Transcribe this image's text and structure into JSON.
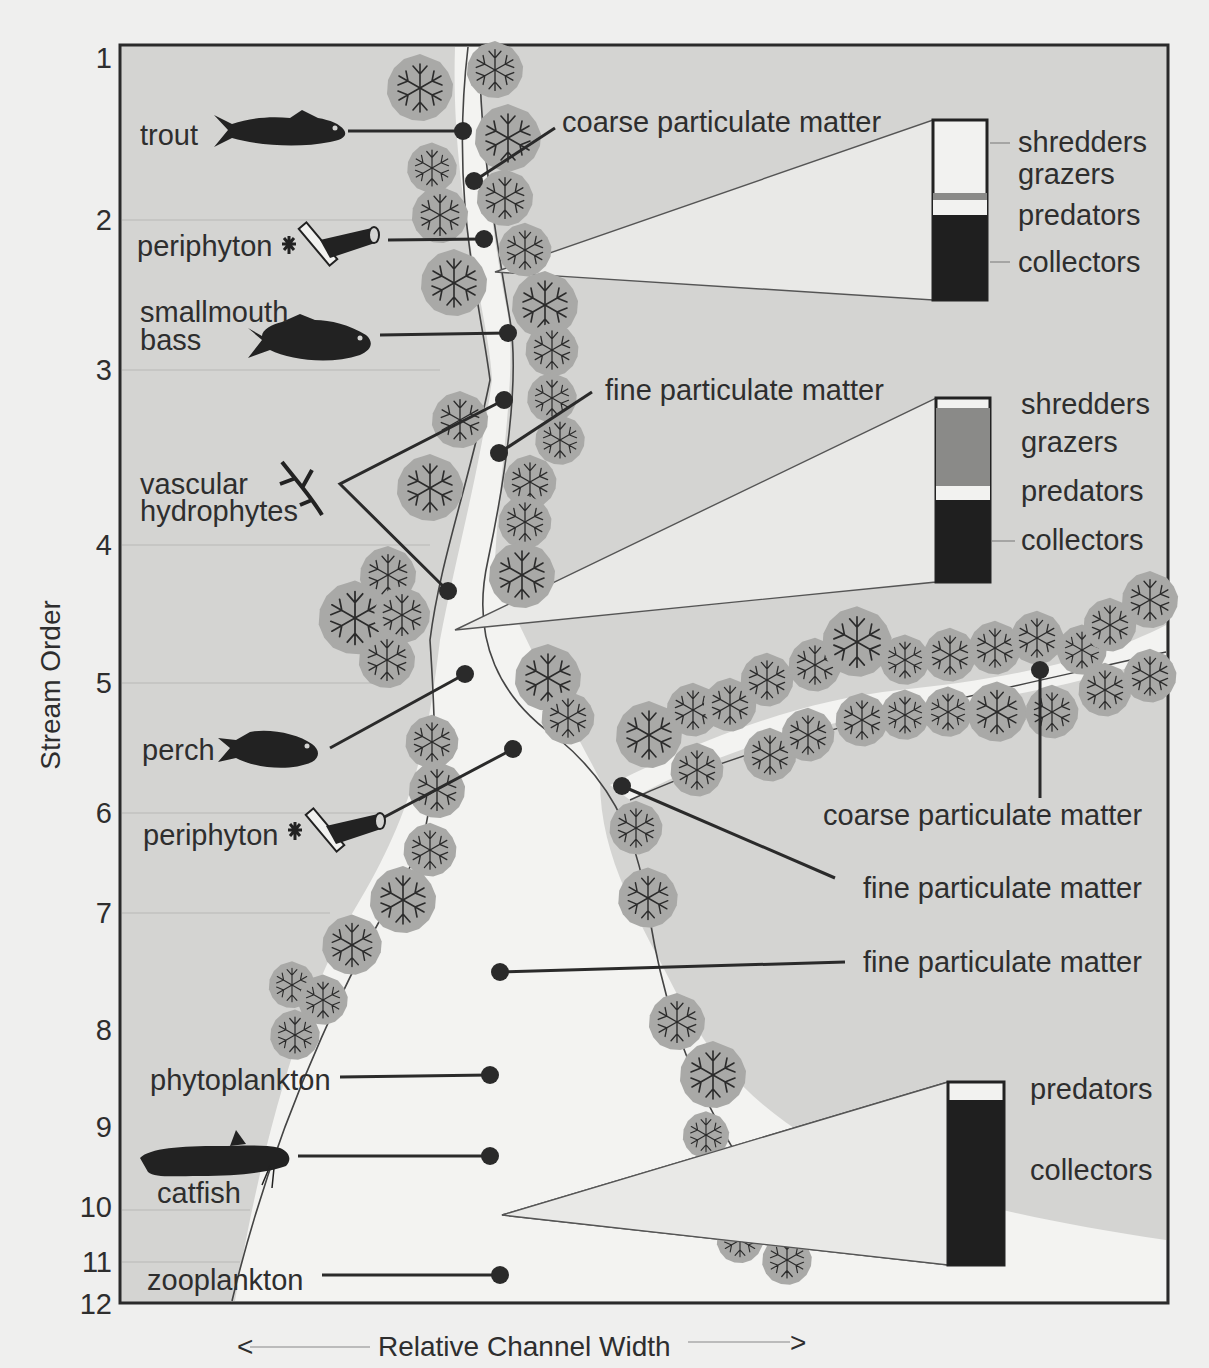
{
  "figure": {
    "y_axis_label": "Stream Order",
    "x_axis_label": "Relative Channel Width",
    "x_axis_arrow_left": "<",
    "x_axis_arrow_right": ">",
    "stream_order_ticks": [
      "1",
      "2",
      "3",
      "4",
      "5",
      "6",
      "7",
      "8",
      "9",
      "10",
      "11",
      "12"
    ],
    "colors": {
      "land": "#d4d4d2",
      "water": "#f3f3f1",
      "tree_canopy": "#a9a9a7",
      "tree_branch": "#2b2b2b",
      "frame": "#2a2a2a",
      "organism": "#222222",
      "bar_dark": "#1f1f1f",
      "bar_light": "#f2f2f0",
      "bar_grazers": "#8a8a88"
    }
  },
  "organisms_left": [
    {
      "id": "trout",
      "label": "trout",
      "icon": "fish-trout-icon",
      "order": 1.5
    },
    {
      "id": "periphyton_upper",
      "label": "periphyton",
      "icon": "periphyton-icon",
      "order": 2.2
    },
    {
      "id": "smallmouth_bass",
      "label": "smallmouth\nbass",
      "label_line1": "smallmouth",
      "label_line2": "bass",
      "icon": "fish-bass-icon",
      "order": 2.8
    },
    {
      "id": "vascular_hydrophytes",
      "label_line1": "vascular",
      "label_line2": "hydrophytes",
      "icon": "hydrophyte-plant-icon",
      "order": 3.8
    },
    {
      "id": "perch",
      "label": "perch",
      "icon": "fish-perch-icon",
      "order": 5.5
    },
    {
      "id": "periphyton_lower",
      "label": "periphyton",
      "icon": "periphyton-icon",
      "order": 6.2
    },
    {
      "id": "phytoplankton",
      "label": "phytoplankton",
      "order": 8.5
    },
    {
      "id": "catfish",
      "label": "catfish",
      "icon": "fish-catfish-icon",
      "order": 9.4
    },
    {
      "id": "zooplankton",
      "label": "zooplankton",
      "order": 11.2
    }
  ],
  "particulate_labels": [
    {
      "id": "cpm_upper",
      "label": "coarse particulate matter"
    },
    {
      "id": "fpm_upper",
      "label": "fine particulate matter"
    },
    {
      "id": "cpm_tributary",
      "label": "coarse particulate matter"
    },
    {
      "id": "fpm_junction",
      "label": "fine particulate matter"
    },
    {
      "id": "fpm_lower",
      "label": "fine particulate matter"
    }
  ],
  "functional_group_bars": [
    {
      "id": "headwaters",
      "stream_order_range": "1-3",
      "segments": [
        {
          "name": "shredders",
          "label": "shredders",
          "fraction": 0.4,
          "shade": "light"
        },
        {
          "name": "grazers",
          "label": "grazers",
          "fraction": 0.04,
          "shade": "mid"
        },
        {
          "name": "predators",
          "label": "predators",
          "fraction": 0.09,
          "shade": "light"
        },
        {
          "name": "collectors",
          "label": "collectors",
          "fraction": 0.47,
          "shade": "dark"
        }
      ]
    },
    {
      "id": "midreaches",
      "stream_order_range": "4-6",
      "segments": [
        {
          "name": "shredders",
          "label": "shredders",
          "fraction": 0.05,
          "shade": "light"
        },
        {
          "name": "grazers",
          "label": "grazers",
          "fraction": 0.44,
          "shade": "mid"
        },
        {
          "name": "predators",
          "label": "predators",
          "fraction": 0.08,
          "shade": "light"
        },
        {
          "name": "collectors",
          "label": "collectors",
          "fraction": 0.43,
          "shade": "dark"
        }
      ]
    },
    {
      "id": "large_rivers",
      "stream_order_range": "7-12",
      "segments": [
        {
          "name": "predators",
          "label": "predators",
          "fraction": 0.08,
          "shade": "light"
        },
        {
          "name": "collectors",
          "label": "collectors",
          "fraction": 0.92,
          "shade": "dark"
        }
      ]
    }
  ]
}
